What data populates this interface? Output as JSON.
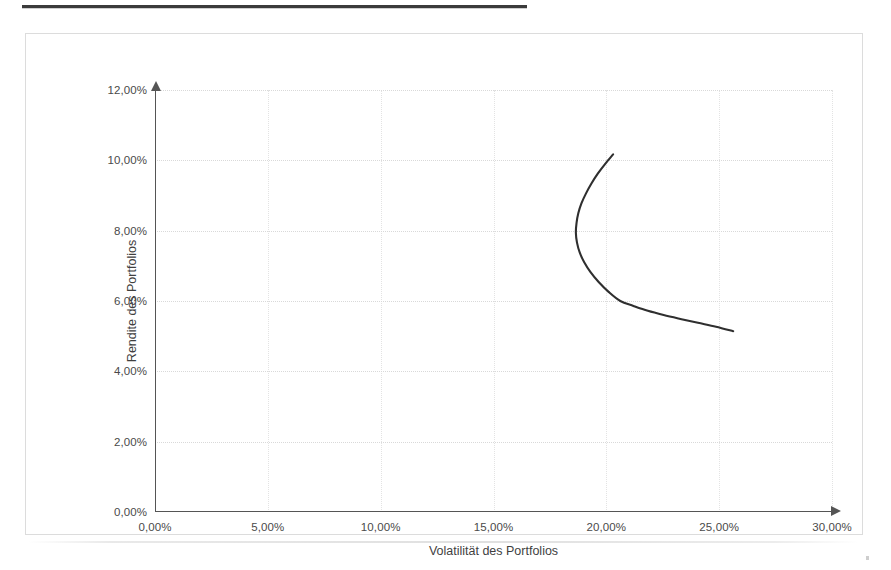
{
  "page": {
    "rule_present": true
  },
  "chart_data": {
    "type": "line",
    "title": "",
    "subtitle": "",
    "xlabel": "Volatilität des Portfolios",
    "ylabel": "Rendite des Portfolios",
    "xlim": [
      0,
      30
    ],
    "ylim": [
      0,
      12
    ],
    "grid": true,
    "legend": "none",
    "x_tick_labels": [
      "0,00%",
      "5,00%",
      "10,00%",
      "15,00%",
      "20,00%",
      "25,00%",
      "30,00%"
    ],
    "x_tick_values": [
      0,
      5,
      10,
      15,
      20,
      25,
      30
    ],
    "y_tick_labels": [
      "0,00%",
      "2,00%",
      "4,00%",
      "6,00%",
      "8,00%",
      "10,00%",
      "12,00%"
    ],
    "y_tick_values": [
      0,
      2,
      4,
      6,
      8,
      10,
      12
    ],
    "series": [
      {
        "name": "Effizienzkurve",
        "color": "#2f2f2f",
        "x": [
          20.3,
          19.95,
          19.62,
          19.34,
          19.1,
          18.9,
          18.76,
          18.68,
          18.65,
          18.7,
          18.82,
          19.02,
          19.3,
          19.66,
          20.1,
          20.62,
          21.2,
          21.84,
          22.54,
          23.28,
          24.06,
          24.86,
          25.62
        ],
        "y": [
          10.17,
          9.9,
          9.62,
          9.34,
          9.06,
          8.78,
          8.5,
          8.22,
          7.94,
          7.66,
          7.38,
          7.1,
          6.82,
          6.54,
          6.26,
          6.0,
          5.86,
          5.72,
          5.6,
          5.49,
          5.38,
          5.27,
          5.14
        ]
      }
    ],
    "annotations": {
      "minimum_variance_point": {
        "x": 18.65,
        "y": 7.94
      },
      "upper_endpoint": {
        "x": 20.3,
        "y": 10.17
      },
      "lower_endpoint": {
        "x": 25.62,
        "y": 5.14
      }
    }
  }
}
